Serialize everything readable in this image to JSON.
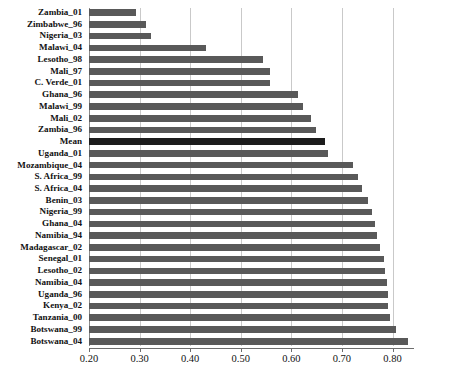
{
  "chart_data": {
    "type": "bar",
    "orientation": "horizontal",
    "title": "",
    "subtitle": "",
    "xlabel": "",
    "ylabel": "",
    "xlim": [
      0.2,
      0.8405
    ],
    "grid": true,
    "legend": false,
    "xticks": [
      "0.20",
      "0.30",
      "0.40",
      "0.50",
      "0.60",
      "0.70",
      "0.80"
    ],
    "xtick_values": [
      0.2,
      0.3,
      0.4,
      0.5,
      0.6,
      0.7,
      0.8
    ],
    "bar_color": "#595959",
    "highlight_color": "#1c1c1c",
    "highlight_category": "Mean",
    "categories": [
      "Zambia_01",
      "Zimbabwe_96",
      "Nigeria_03",
      "Malawi_04",
      "Lesotho_98",
      "Mali_97",
      "C. Verde_01",
      "Ghana_96",
      "Malawi_99",
      "Mali_02",
      "Zambia_96",
      "Mean",
      "Uganda_01",
      "Mozambique_04",
      "S. Africa_99",
      "S. Africa_04",
      "Benin_03",
      "Nigeria_99",
      "Ghana_04",
      "Namibia_94",
      "Madagascar_02",
      "Senegal_01",
      "Lesotho_02",
      "Namibia_04",
      "Uganda_96",
      "Kenya_02",
      "Tanzania_00",
      "Botswana_99",
      "Botswana_04"
    ],
    "values": [
      0.292,
      0.312,
      0.323,
      0.432,
      0.543,
      0.558,
      0.558,
      0.613,
      0.623,
      0.638,
      0.648,
      0.667,
      0.673,
      0.722,
      0.731,
      0.739,
      0.751,
      0.76,
      0.765,
      0.77,
      0.775,
      0.783,
      0.786,
      0.79,
      0.791,
      0.792,
      0.796,
      0.806,
      0.831
    ]
  }
}
